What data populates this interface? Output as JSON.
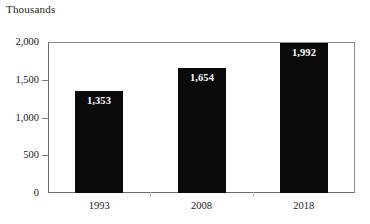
{
  "chart_data": {
    "type": "bar",
    "title": "",
    "unit_label": "Thousands",
    "xlabel": "",
    "ylabel": "",
    "categories": [
      "1993",
      "2008",
      "2018"
    ],
    "values": [
      1353,
      1654,
      1992
    ],
    "value_labels": [
      "1,353",
      "1,654",
      "1,992"
    ],
    "series": [
      {
        "name": "",
        "values": [
          1353,
          1654,
          1992
        ]
      }
    ],
    "ylim": [
      0,
      2000
    ],
    "yticks": [
      0,
      500,
      1000,
      1500,
      2000
    ],
    "ytick_labels": [
      "0",
      "500",
      "1,000",
      "1,500",
      "2,000"
    ],
    "grid": false,
    "legend": false,
    "legend_position": "none",
    "bar_color": "#0a0a0a",
    "value_label_color": "#ffffff",
    "frame_color": "#8e8e8e",
    "background_color": "#ffffff"
  }
}
